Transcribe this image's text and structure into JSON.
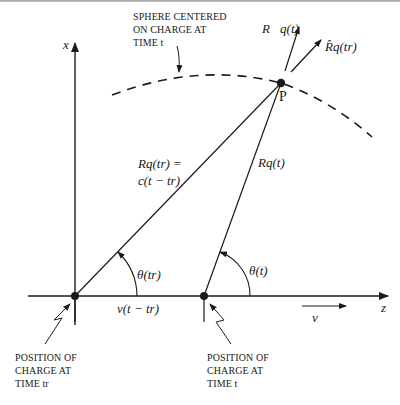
{
  "diagram": {
    "labels": {
      "sphere_note": [
        "SPHERE CENTERED",
        "ON CHARGE AT",
        "TIME t"
      ],
      "x_axis": "x",
      "z_axis": "z",
      "point_p": "P",
      "R_vec_t": "R⃗q(t)",
      "R_hat_tr": "R̂q(tr)",
      "R_tr_line1": "Rq(tr) =",
      "R_tr_line2": "c(t − tr)",
      "R_t": "Rq(t)",
      "theta_tr": "θ(tr)",
      "theta_t": "θ(t)",
      "v_dist": "v(t − tr)",
      "v_vec": "v⃗",
      "pos_tr": [
        "POSITION OF",
        "CHARGE AT",
        "TIME tr"
      ],
      "pos_t": [
        "POSITION OF",
        "CHARGE AT",
        "TIME t"
      ]
    },
    "points": {
      "charge_tr": [
        75,
        296
      ],
      "charge_t": [
        204,
        296
      ],
      "P": [
        281,
        83
      ]
    },
    "colors": {
      "ink": "#1a1a1a",
      "background": "#ffffff"
    }
  }
}
